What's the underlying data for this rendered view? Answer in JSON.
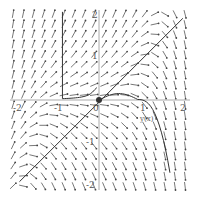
{
  "diagram": {
    "type": "direction-field",
    "x_range": [
      -2,
      2
    ],
    "y_range": [
      -2,
      2
    ],
    "x_ticks": [
      "-2",
      "-1",
      "0",
      "1",
      "2"
    ],
    "y_ticks": [
      "2",
      "1",
      "-1",
      "-2"
    ],
    "curve_label": "y(x)",
    "colors": {
      "arrows": "#444444",
      "curves": "#333333",
      "axes": "#999999",
      "background": "#ffffff"
    }
  }
}
